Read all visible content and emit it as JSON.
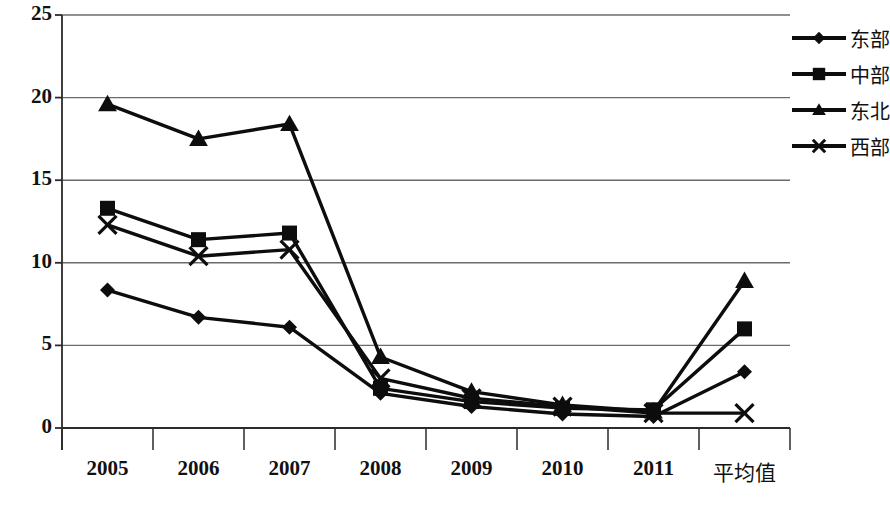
{
  "chart_data": {
    "type": "line",
    "title": "",
    "xlabel": "",
    "ylabel": "",
    "categories": [
      "2005",
      "2006",
      "2007",
      "2008",
      "2009",
      "2010",
      "2011",
      "平均值"
    ],
    "ylim": [
      0,
      25
    ],
    "yticks": [
      0,
      5,
      10,
      15,
      20,
      25
    ],
    "grid": true,
    "legend_position": "right",
    "series": [
      {
        "name": "东部",
        "marker": "diamond",
        "values": [
          8.35,
          6.7,
          6.1,
          2.1,
          1.3,
          0.85,
          0.7,
          3.4
        ]
      },
      {
        "name": "中部",
        "marker": "square",
        "values": [
          13.3,
          11.4,
          11.8,
          2.4,
          1.6,
          1.2,
          1.1,
          6.0
        ]
      },
      {
        "name": "东北",
        "marker": "triangle",
        "values": [
          19.6,
          17.5,
          18.4,
          4.3,
          2.2,
          1.4,
          1.0,
          8.9
        ]
      },
      {
        "name": "西部",
        "marker": "cross",
        "values": [
          12.3,
          10.4,
          10.8,
          3.0,
          1.8,
          1.3,
          0.9,
          0.9
        ]
      }
    ]
  },
  "axis": {
    "ytick_labels": [
      "25",
      "20",
      "15",
      "10",
      "5",
      "0"
    ],
    "xtick_labels": [
      "2005",
      "2006",
      "2007",
      "2008",
      "2009",
      "2010",
      "2011",
      "平均值"
    ]
  },
  "legend": {
    "items": [
      {
        "label": "东部",
        "marker": "diamond-marker-icon"
      },
      {
        "label": "中部",
        "marker": "square-marker-icon"
      },
      {
        "label": "东北",
        "marker": "triangle-marker-icon"
      },
      {
        "label": "西部",
        "marker": "cross-marker-icon"
      }
    ]
  },
  "colors": {
    "series": "#0d0d0d",
    "grid": "#6b6b6b",
    "axis": "#2b2b2b",
    "background": "#ffffff"
  }
}
